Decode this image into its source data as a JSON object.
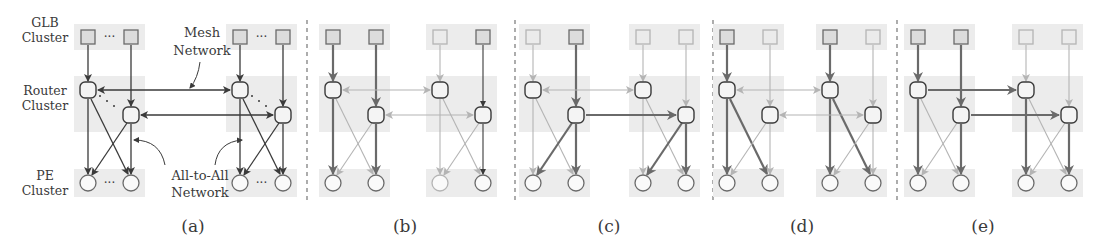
{
  "figure": {
    "row_labels": [
      {
        "lines": [
          "GLB",
          "Cluster"
        ],
        "x": 45,
        "y": 27
      },
      {
        "lines": [
          "Router",
          "Cluster"
        ],
        "x": 45,
        "y": 95
      },
      {
        "lines": [
          "PE",
          "Cluster"
        ],
        "x": 45,
        "y": 180
      }
    ],
    "annotations": {
      "mesh": {
        "lines": [
          "Mesh",
          "Network"
        ],
        "x": 202,
        "y": 37
      },
      "all_to_all": {
        "lines": [
          "All-to-All",
          "Network"
        ],
        "x": 200,
        "y": 180
      }
    },
    "dots": "···",
    "colors": {
      "dark": "#3a3a3a",
      "mid": "#6a6a6a",
      "light": "#b4b4b4",
      "shade": "#ececec",
      "node_fill_dark": "#dcdcdc",
      "node_fill_light": "#ebebeb"
    },
    "panels": [
      {
        "id": "a",
        "caption": "(a)",
        "cx": 193,
        "groups": [
          88,
          240
        ],
        "type": "a"
      },
      {
        "id": "b",
        "caption": "(b)",
        "cx": 405,
        "groups": [
          333,
          440
        ],
        "type": "b"
      },
      {
        "id": "c",
        "caption": "(c)",
        "cx": 609,
        "groups": [
          533,
          643
        ],
        "type": "c"
      },
      {
        "id": "d",
        "caption": "(d)",
        "cx": 802,
        "groups": [
          727,
          830
        ],
        "type": "d"
      },
      {
        "id": "e",
        "caption": "(e)",
        "cx": 983,
        "groups": [
          918,
          1026
        ],
        "type": "e"
      }
    ],
    "separators_x": [
      307,
      515,
      713,
      897
    ]
  }
}
